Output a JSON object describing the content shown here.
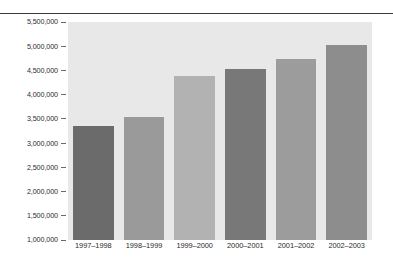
{
  "chart_data": {
    "type": "bar",
    "title": "",
    "subtitle": "",
    "xlabel": "",
    "ylabel": "",
    "categories": [
      "1997–1998",
      "1998–1999",
      "1999–2000",
      "2000–2001",
      "2001–2002",
      "2002–2003"
    ],
    "values": [
      3360000,
      3530000,
      4380000,
      4540000,
      4740000,
      5030000
    ],
    "bar_colors": [
      "#6b6b6b",
      "#9a9a9a",
      "#b2b2b2",
      "#787878",
      "#9c9c9c",
      "#8d8d8d"
    ],
    "ylim": [
      1000000,
      5500000
    ],
    "ytick_values": [
      5500000,
      5000000,
      4500000,
      4000000,
      3500000,
      3000000,
      2500000,
      2000000,
      1500000,
      1000000
    ],
    "ytick_labels": [
      "5,500,000",
      "5,000,000",
      "4,500,000",
      "4,000,000",
      "3,500,000",
      "3,000,000",
      "2,500,000",
      "2,000,000",
      "1,500,000",
      "1,000,000"
    ],
    "grid": false,
    "legend": null,
    "plot_background": "#e8e8e8",
    "page_background": "#ffffff",
    "rule_color": "#3b3b3b",
    "tick_color": "#6a6a6a",
    "text_color": "#2b2b2b"
  }
}
